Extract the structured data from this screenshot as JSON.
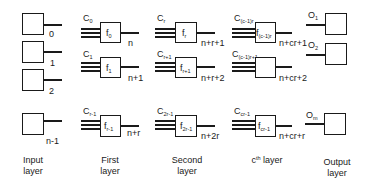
{
  "diagram": {
    "layers": {
      "input": {
        "caption_line1": "Input",
        "caption_line2": "layer",
        "nodes": [
          {
            "index_label": "0"
          },
          {
            "index_label": "1"
          },
          {
            "index_label": "2"
          },
          {
            "index_label": "n-1"
          }
        ]
      },
      "first": {
        "caption_line1": "First",
        "caption_line2": "layer",
        "nodes": [
          {
            "c_base": "C",
            "c_sub": "0",
            "f_base": "f",
            "f_sub": "0",
            "out_label": "n"
          },
          {
            "c_base": "C",
            "c_sub": "1",
            "f_base": "f",
            "f_sub": "1",
            "out_label": "n+1"
          },
          {
            "c_base": "C",
            "c_sub": "r-1",
            "f_base": "f",
            "f_sub": "r-1",
            "out_label": "n+r"
          }
        ]
      },
      "second": {
        "caption_line1": "Second",
        "caption_line2": "layer",
        "nodes": [
          {
            "c_base": "C",
            "c_sub": "r",
            "f_base": "f",
            "f_sub": "r",
            "out_label": "n+r+1"
          },
          {
            "c_base": "C",
            "c_sub": "r+1",
            "f_base": "f",
            "f_sub": "r+1",
            "out_label": "n+r+2"
          },
          {
            "c_base": "C",
            "c_sub": "2r-1",
            "f_base": "f",
            "f_sub": "2r-1",
            "out_label": "n+2r"
          }
        ]
      },
      "cth": {
        "caption_c": "c",
        "caption_sup": "th",
        "caption_rest": " layer",
        "nodes": [
          {
            "c_base": "C",
            "c_sub": "(c-1)r",
            "f_base": "f",
            "f_sub": "(c-1)r",
            "out_label": "n+cr+1"
          },
          {
            "c_base": "C",
            "c_sub": "(c-1)r+1",
            "f_base": "",
            "f_sub": "",
            "out_label": "n+cr+2"
          },
          {
            "c_base": "C",
            "c_sub": "cr-1",
            "f_base": "f",
            "f_sub": "cr-1",
            "out_label": "n+cr+r"
          }
        ]
      },
      "output": {
        "caption_line1": "Output",
        "caption_line2": "layer",
        "nodes": [
          {
            "o_base": "O",
            "o_sub": "1"
          },
          {
            "o_base": "O",
            "o_sub": "2"
          },
          {
            "o_base": "O",
            "o_sub": "m"
          }
        ]
      }
    }
  }
}
